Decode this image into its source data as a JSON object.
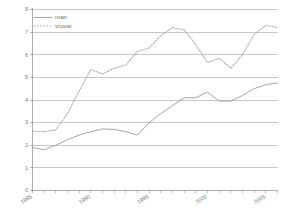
{
  "chart_data": {
    "type": "line",
    "title": "",
    "subtitle": "",
    "xlabel": "",
    "ylabel": "",
    "xlim": [
      1985,
      2006
    ],
    "ylim": [
      0,
      8
    ],
    "grid": true,
    "legend_position": "top-left",
    "y_ticks": [
      "0",
      "1",
      "2",
      "3",
      "4",
      "5",
      "6",
      "7",
      "8"
    ],
    "y_tick_values": [
      0,
      1,
      2,
      3,
      4,
      5,
      6,
      7,
      8
    ],
    "x_ticks": [
      "1985",
      "1990",
      "1995",
      "2000",
      "2005"
    ],
    "x_tick_values": [
      1985,
      1990,
      1995,
      2000,
      2005
    ],
    "x": [
      1985,
      1986,
      1987,
      1988,
      1989,
      1990,
      1991,
      1992,
      1993,
      1994,
      1995,
      1996,
      1997,
      1998,
      1999,
      2000,
      2001,
      2002,
      2003,
      2004,
      2005,
      2006
    ],
    "series": [
      {
        "name": "man",
        "style": "solid",
        "color": "#9b9b9b",
        "values": [
          1.9,
          1.8,
          2.0,
          2.25,
          2.45,
          2.6,
          2.72,
          2.7,
          2.6,
          2.45,
          3.0,
          3.4,
          3.75,
          4.1,
          4.1,
          4.35,
          3.95,
          3.95,
          4.2,
          4.5,
          4.68,
          4.75
        ]
      },
      {
        "name": "vrouw",
        "style": "dotted",
        "color": "#adadad",
        "values": [
          2.62,
          2.6,
          2.68,
          3.4,
          4.4,
          5.35,
          5.15,
          5.4,
          5.55,
          6.15,
          6.3,
          6.85,
          7.2,
          7.1,
          6.45,
          5.65,
          5.85,
          5.4,
          6.0,
          6.9,
          7.3,
          7.2
        ]
      }
    ],
    "legend": [
      {
        "label": "man",
        "style": "solid"
      },
      {
        "label": "vrouw",
        "style": "dotted"
      }
    ]
  }
}
